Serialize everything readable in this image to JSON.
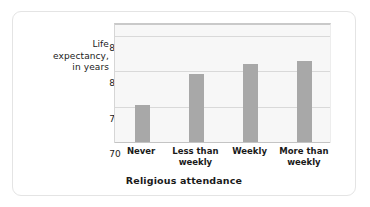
{
  "chart_data": {
    "type": "bar",
    "title": "",
    "xlabel": "Religious attendance",
    "ylabel": "Life expectancy, in years",
    "ylabel_lines": [
      "Life",
      "expectancy,",
      "in years"
    ],
    "categories": [
      "Never",
      "Less than weekly",
      "Weekly",
      "More than weekly"
    ],
    "category_lines": [
      [
        "Never"
      ],
      [
        "Less than",
        "weekly"
      ],
      [
        "Weekly"
      ],
      [
        "More than",
        "weekly"
      ]
    ],
    "values": [
      75.2,
      79.7,
      81.0,
      81.5
    ],
    "ylim": [
      70,
      87
    ],
    "yticks": [
      70,
      75,
      80,
      85
    ],
    "ytick_labels": [
      "70",
      "75",
      "80",
      "85"
    ],
    "gridlines": [
      75,
      80,
      85
    ],
    "grid": true,
    "legend": "none",
    "bar_color": "#a8a8a8",
    "plot_background": "#f7f7f7",
    "gridline_color": "#d9d9d9",
    "card_border_color": "#e4e4e4",
    "text_color": "#1a1a1a"
  }
}
